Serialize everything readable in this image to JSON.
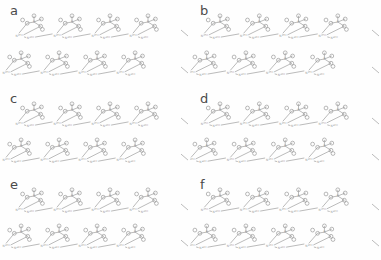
{
  "figure": {
    "background_color": "#fefefe",
    "line_color": "#8d8d8d",
    "atom_stroke_color": "#9a9a9a",
    "label_color": "#4a4a4a",
    "columns": 2,
    "rows": 3,
    "panel_count": 6
  },
  "panels": [
    {
      "id": "a",
      "label": "a",
      "x": 0,
      "y": 0,
      "width": 190,
      "height": 88,
      "chain_rows": 2,
      "units_per_row": 4,
      "motif": "phosphate-amine hydrogen-bonded chain",
      "density": "standard"
    },
    {
      "id": "b",
      "label": "b",
      "x": 190,
      "y": 0,
      "width": 191,
      "height": 88,
      "chain_rows": 2,
      "units_per_row": 4,
      "motif": "phosphate-amine hydrogen-bonded chain",
      "density": "dense"
    },
    {
      "id": "c",
      "label": "c",
      "x": 0,
      "y": 88,
      "width": 190,
      "height": 86,
      "chain_rows": 2,
      "units_per_row": 4,
      "motif": "phosphate-amine hydrogen-bonded chain",
      "density": "standard"
    },
    {
      "id": "d",
      "label": "d",
      "x": 190,
      "y": 88,
      "width": 191,
      "height": 86,
      "chain_rows": 2,
      "units_per_row": 4,
      "motif": "phosphate-amine hydrogen-bonded chain",
      "density": "dense"
    },
    {
      "id": "e",
      "label": "e",
      "x": 0,
      "y": 174,
      "width": 190,
      "height": 86,
      "chain_rows": 2,
      "units_per_row": 4,
      "motif": "phosphate-amine hydrogen-bonded chain",
      "density": "standard"
    },
    {
      "id": "f",
      "label": "f",
      "x": 190,
      "y": 174,
      "width": 191,
      "height": 86,
      "chain_rows": 2,
      "units_per_row": 4,
      "motif": "phosphate-amine hydrogen-bonded chain",
      "density": "dense"
    }
  ],
  "atom_labels": {
    "phosphorus": "P",
    "oxygen": "O",
    "nitrogen": "N",
    "hydrogen": "H"
  }
}
